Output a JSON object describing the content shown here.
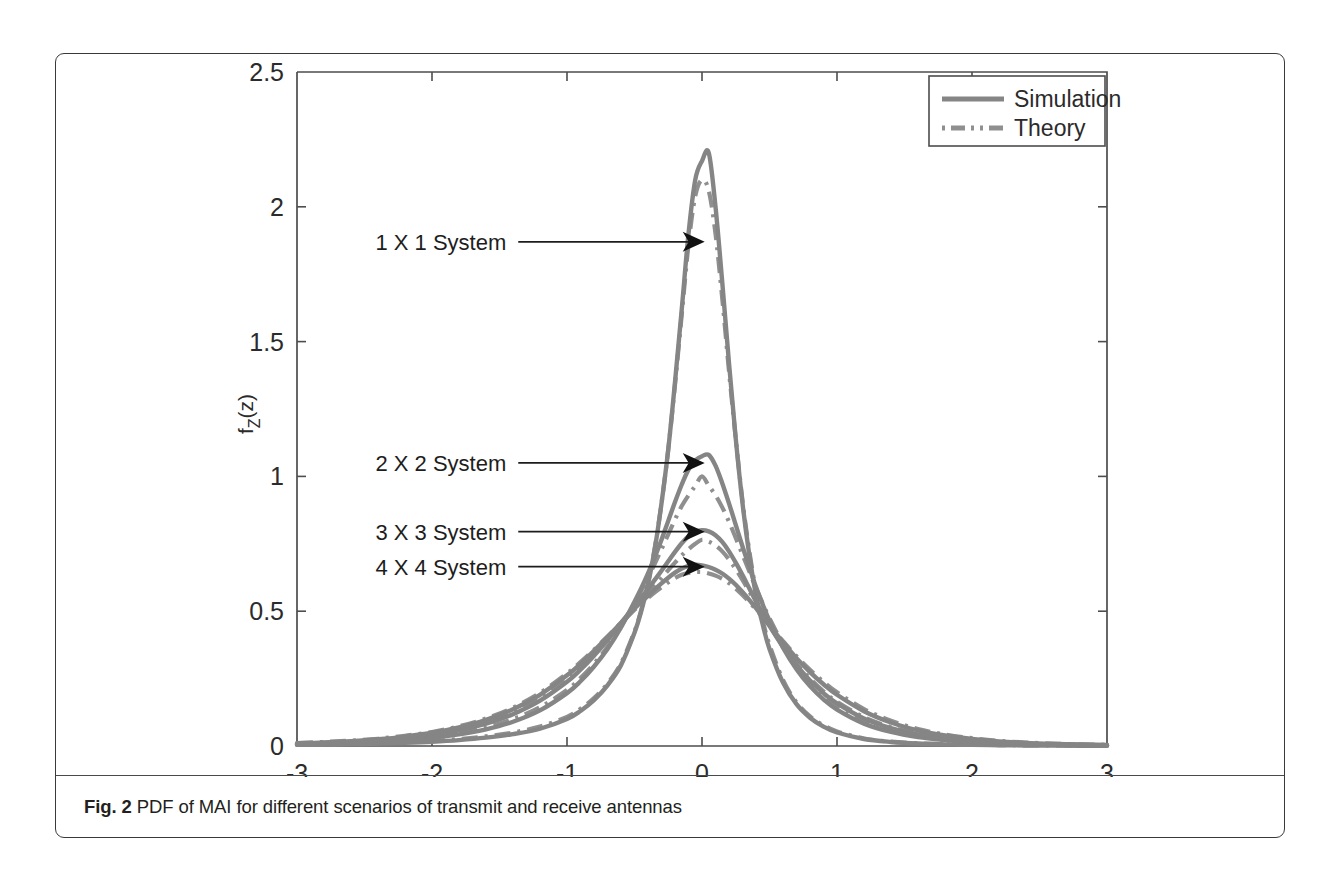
{
  "caption": {
    "figure_number": "Fig. 2",
    "text": " PDF of MAI for different scenarios of transmit and receive antennas"
  },
  "chart_data": {
    "type": "line",
    "title": "",
    "xlabel": "z",
    "ylabel": "f_Z(z)",
    "xlim": [
      -3,
      3
    ],
    "ylim": [
      0,
      2.5
    ],
    "xticks": [
      -3,
      -2,
      -1,
      0,
      1,
      2,
      3
    ],
    "xtick_labels": [
      "-3",
      "-2",
      "-1",
      "0",
      "1",
      "2",
      "3"
    ],
    "yticks": [
      0,
      0.5,
      1,
      1.5,
      2,
      2.5
    ],
    "ytick_labels": [
      "0",
      "0.5",
      "1",
      "1.5",
      "2",
      "2.5"
    ],
    "grid": false,
    "legend_position": "upper right",
    "legend_entries": [
      {
        "label": "Simulation",
        "style": "solid",
        "color": "#858585"
      },
      {
        "label": "Theory",
        "style": "dash-dot",
        "color": "#8f8f8f"
      }
    ],
    "annotations": [
      {
        "label": "1 X 1 System",
        "text_x": -1.45,
        "text_y": 1.87,
        "arrow_to_x": 0.02,
        "arrow_to_y": 1.87
      },
      {
        "label": "2 X 2 System",
        "text_x": -1.45,
        "text_y": 1.05,
        "arrow_to_x": 0.02,
        "arrow_to_y": 1.05
      },
      {
        "label": "3 X 3 System",
        "text_x": -1.45,
        "text_y": 0.795,
        "arrow_to_x": 0.02,
        "arrow_to_y": 0.795
      },
      {
        "label": "4 X 4 System",
        "text_x": -1.45,
        "text_y": 0.665,
        "arrow_to_x": 0.02,
        "arrow_to_y": 0.665
      }
    ],
    "x": [
      -3.0,
      -2.8,
      -2.6,
      -2.4,
      -2.2,
      -2.0,
      -1.8,
      -1.6,
      -1.4,
      -1.2,
      -1.0,
      -0.9,
      -0.8,
      -0.7,
      -0.6,
      -0.5,
      -0.45,
      -0.4,
      -0.35,
      -0.3,
      -0.25,
      -0.2,
      -0.15,
      -0.1,
      -0.05,
      0.0,
      0.05,
      0.1,
      0.15,
      0.2,
      0.25,
      0.3,
      0.35,
      0.4,
      0.45,
      0.5,
      0.6,
      0.7,
      0.8,
      0.9,
      1.0,
      1.2,
      1.4,
      1.6,
      1.8,
      2.0,
      2.2,
      2.4,
      2.6,
      2.8,
      3.0
    ],
    "series": [
      {
        "name": "1 X 1 System",
        "kind": "simulation",
        "style": "solid",
        "peak": 2.2,
        "peak_x": 0.03,
        "values": [
          0.004,
          0.005,
          0.007,
          0.009,
          0.012,
          0.016,
          0.022,
          0.031,
          0.044,
          0.064,
          0.1,
          0.13,
          0.17,
          0.225,
          0.3,
          0.42,
          0.5,
          0.6,
          0.73,
          0.9,
          1.1,
          1.35,
          1.62,
          1.9,
          2.1,
          2.17,
          2.2,
          2.0,
          1.72,
          1.42,
          1.14,
          0.9,
          0.71,
          0.56,
          0.45,
          0.36,
          0.235,
          0.155,
          0.105,
          0.072,
          0.05,
          0.026,
          0.015,
          0.009,
          0.006,
          0.004,
          0.003,
          0.002,
          0.0015,
          0.001,
          0.001
        ]
      },
      {
        "name": "1 X 1 System",
        "kind": "theory",
        "style": "dash-dot",
        "peak": 2.1,
        "peak_x": 0.0,
        "values": [
          0.005,
          0.006,
          0.008,
          0.011,
          0.014,
          0.019,
          0.026,
          0.036,
          0.05,
          0.072,
          0.108,
          0.138,
          0.178,
          0.232,
          0.307,
          0.425,
          0.505,
          0.605,
          0.735,
          0.9,
          1.1,
          1.34,
          1.6,
          1.86,
          2.04,
          2.1,
          2.06,
          1.9,
          1.66,
          1.39,
          1.14,
          0.91,
          0.725,
          0.575,
          0.465,
          0.375,
          0.245,
          0.162,
          0.11,
          0.077,
          0.054,
          0.028,
          0.016,
          0.01,
          0.007,
          0.005,
          0.0035,
          0.0025,
          0.002,
          0.0015,
          0.001
        ]
      },
      {
        "name": "2 X 2 System",
        "kind": "simulation",
        "style": "solid",
        "peak": 1.08,
        "peak_x": 0.03,
        "values": [
          0.006,
          0.008,
          0.011,
          0.015,
          0.021,
          0.03,
          0.043,
          0.062,
          0.09,
          0.132,
          0.196,
          0.24,
          0.295,
          0.36,
          0.44,
          0.535,
          0.585,
          0.64,
          0.7,
          0.765,
          0.835,
          0.905,
          0.97,
          1.025,
          1.06,
          1.075,
          1.08,
          1.04,
          0.975,
          0.9,
          0.82,
          0.74,
          0.665,
          0.59,
          0.525,
          0.465,
          0.365,
          0.285,
          0.222,
          0.173,
          0.135,
          0.083,
          0.052,
          0.033,
          0.022,
          0.014,
          0.0095,
          0.0065,
          0.0045,
          0.003,
          0.002
        ]
      },
      {
        "name": "2 X 2 System",
        "kind": "theory",
        "style": "dash-dot",
        "peak": 1.0,
        "peak_x": 0.0,
        "values": [
          0.007,
          0.009,
          0.012,
          0.017,
          0.024,
          0.034,
          0.048,
          0.069,
          0.1,
          0.144,
          0.208,
          0.252,
          0.305,
          0.368,
          0.443,
          0.53,
          0.576,
          0.624,
          0.676,
          0.73,
          0.785,
          0.84,
          0.89,
          0.93,
          0.965,
          1.0,
          0.965,
          0.93,
          0.885,
          0.832,
          0.772,
          0.71,
          0.648,
          0.586,
          0.528,
          0.474,
          0.378,
          0.3,
          0.237,
          0.187,
          0.148,
          0.093,
          0.059,
          0.038,
          0.025,
          0.016,
          0.011,
          0.0075,
          0.005,
          0.0035,
          0.0025
        ]
      },
      {
        "name": "3 X 3 System",
        "kind": "simulation",
        "style": "solid",
        "peak": 0.8,
        "peak_x": 0.0,
        "values": [
          0.008,
          0.011,
          0.015,
          0.021,
          0.029,
          0.041,
          0.058,
          0.083,
          0.118,
          0.168,
          0.238,
          0.283,
          0.335,
          0.393,
          0.456,
          0.52,
          0.551,
          0.582,
          0.616,
          0.65,
          0.685,
          0.72,
          0.752,
          0.778,
          0.794,
          0.8,
          0.796,
          0.782,
          0.757,
          0.722,
          0.68,
          0.634,
          0.585,
          0.536,
          0.49,
          0.446,
          0.368,
          0.3,
          0.243,
          0.196,
          0.158,
          0.102,
          0.066,
          0.043,
          0.028,
          0.018,
          0.012,
          0.008,
          0.0055,
          0.004,
          0.0028
        ]
      },
      {
        "name": "3 X 3 System",
        "kind": "theory",
        "style": "dash-dot",
        "peak": 0.765,
        "peak_x": 0.0,
        "values": [
          0.009,
          0.012,
          0.017,
          0.023,
          0.032,
          0.045,
          0.063,
          0.09,
          0.126,
          0.178,
          0.247,
          0.291,
          0.34,
          0.394,
          0.452,
          0.511,
          0.539,
          0.566,
          0.595,
          0.623,
          0.652,
          0.68,
          0.707,
          0.73,
          0.75,
          0.765,
          0.758,
          0.744,
          0.722,
          0.692,
          0.656,
          0.616,
          0.573,
          0.53,
          0.488,
          0.447,
          0.372,
          0.306,
          0.25,
          0.203,
          0.164,
          0.107,
          0.07,
          0.046,
          0.03,
          0.02,
          0.013,
          0.0085,
          0.006,
          0.004,
          0.003
        ]
      },
      {
        "name": "4 X 4 System",
        "kind": "simulation",
        "style": "solid",
        "peak": 0.67,
        "peak_x": 0.0,
        "values": [
          0.01,
          0.013,
          0.018,
          0.025,
          0.035,
          0.049,
          0.069,
          0.097,
          0.136,
          0.19,
          0.262,
          0.305,
          0.353,
          0.404,
          0.457,
          0.51,
          0.534,
          0.557,
          0.581,
          0.603,
          0.624,
          0.643,
          0.658,
          0.668,
          0.672,
          0.67,
          0.664,
          0.654,
          0.64,
          0.621,
          0.598,
          0.571,
          0.542,
          0.511,
          0.479,
          0.447,
          0.384,
          0.326,
          0.274,
          0.229,
          0.19,
          0.129,
          0.087,
          0.058,
          0.039,
          0.026,
          0.017,
          0.0115,
          0.008,
          0.0055,
          0.004
        ]
      },
      {
        "name": "4 X 4 System",
        "kind": "theory",
        "style": "dash-dot",
        "peak": 0.645,
        "peak_x": 0.0,
        "values": [
          0.011,
          0.015,
          0.02,
          0.027,
          0.038,
          0.052,
          0.073,
          0.102,
          0.142,
          0.197,
          0.269,
          0.311,
          0.357,
          0.406,
          0.456,
          0.505,
          0.528,
          0.549,
          0.57,
          0.589,
          0.607,
          0.623,
          0.635,
          0.642,
          0.645,
          0.645,
          0.64,
          0.632,
          0.62,
          0.604,
          0.584,
          0.56,
          0.534,
          0.506,
          0.477,
          0.448,
          0.389,
          0.333,
          0.283,
          0.238,
          0.199,
          0.137,
          0.094,
          0.063,
          0.043,
          0.029,
          0.019,
          0.013,
          0.009,
          0.006,
          0.0045
        ]
      }
    ]
  }
}
